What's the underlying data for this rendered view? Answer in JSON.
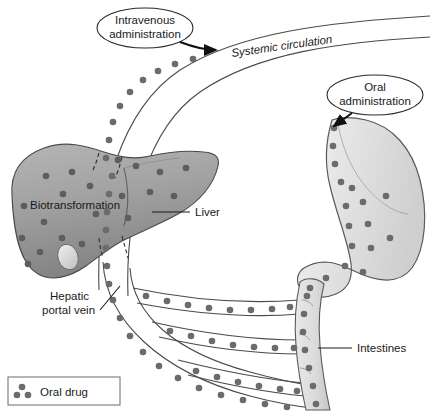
{
  "figure": {
    "background": "#ffffff"
  },
  "callouts": [
    {
      "id": "intravenous",
      "line1": "Intravenous",
      "line2": "administration",
      "cx": 145,
      "cy": 28,
      "rx": 48,
      "ry": 20
    },
    {
      "id": "oral",
      "line1": "Oral",
      "line2": "administration",
      "cx": 375,
      "cy": 95,
      "rx": 48,
      "ry": 20
    }
  ],
  "labels": {
    "systemic_circulation": "Systemic circulation",
    "biotransformation": "Biotransformation",
    "liver": "Liver",
    "hepatic_portal_vein_line1": "Hepatic",
    "hepatic_portal_vein_line2": "portal vein",
    "intestines": "Intestines"
  },
  "legend": {
    "label": "Oral drug",
    "dot_color": "#6b6b6b",
    "box_x": 8,
    "box_y": 377,
    "box_w": 112,
    "box_h": 28
  },
  "colors": {
    "liver_fill": "#a3a3a3",
    "liver_fill_dark": "#8a8a8a",
    "liver_edge": "#4a4a4a",
    "stomach_fill": "#ececec",
    "stomach_fill_shade": "#d2d2d2",
    "stomach_edge": "#5a5a5a",
    "intestine_fill": "#dcdcdc",
    "vessel_stroke": "#4a4a4a",
    "drug_dot": "#6b6b6b",
    "drug_dot_liver": "#5e5e5e",
    "text": "#1a1a1a",
    "leader": "#1a1a1a"
  },
  "organs": {
    "liver": {
      "name": "liver",
      "label": "Liver"
    },
    "stomach": {
      "name": "stomach",
      "label": "Stomach"
    },
    "intestine": {
      "name": "intestine",
      "label": "Intestines"
    }
  }
}
